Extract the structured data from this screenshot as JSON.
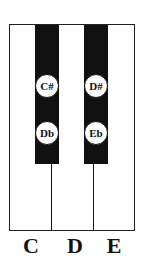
{
  "diagram": {
    "white_keys": [
      {
        "label": "C"
      },
      {
        "label": "D"
      },
      {
        "label": "E"
      }
    ],
    "black_keys": [
      {
        "sharp": "C#",
        "flat": "Db"
      },
      {
        "sharp": "D#",
        "flat": "Eb"
      }
    ],
    "colors": {
      "black_key": "#111111",
      "white_key": "#ffffff",
      "outline": "#222222"
    }
  }
}
